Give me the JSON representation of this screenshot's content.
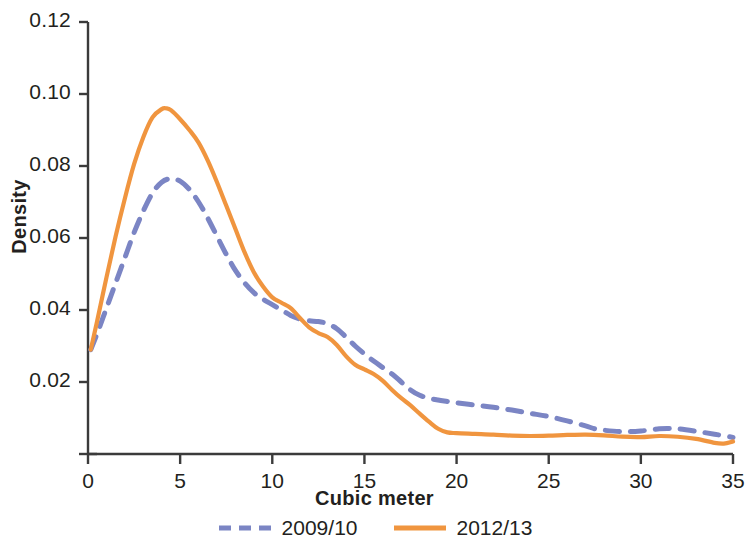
{
  "chart_data": {
    "type": "line",
    "title": "",
    "xlabel": "Cubic meter",
    "ylabel": "Density",
    "xlim": [
      0,
      35
    ],
    "ylim": [
      0,
      0.12
    ],
    "grid": false,
    "legend_position": "bottom",
    "xticks": [
      0,
      5,
      10,
      15,
      20,
      25,
      30,
      35
    ],
    "xtick_labels": [
      "0",
      "5",
      "10",
      "15",
      "20",
      "25",
      "30",
      "35"
    ],
    "yticks": [
      0.02,
      0.04,
      0.06,
      0.08,
      0.1,
      0.12
    ],
    "ytick_labels": [
      "0.02",
      "0.04",
      "0.06",
      "0.08",
      "0.10",
      "0.12"
    ],
    "series": [
      {
        "name": "2009/10",
        "color": "#7b85c4",
        "style": "dashed",
        "x": [
          0.15,
          0.5,
          1,
          1.5,
          2,
          2.5,
          3,
          3.5,
          4,
          4.5,
          5,
          5.5,
          6,
          6.5,
          7,
          7.5,
          8,
          8.5,
          9,
          9.5,
          10,
          10.5,
          11,
          11.5,
          12,
          12.5,
          13,
          13.5,
          14,
          14.5,
          15,
          15.5,
          16,
          16.5,
          17,
          17.5,
          18,
          18.5,
          19,
          19.5,
          20,
          21,
          22,
          23,
          24,
          25,
          26,
          27,
          27.5,
          28,
          29,
          30,
          31,
          31.5,
          32,
          33,
          34,
          35
        ],
        "y": [
          0.029,
          0.0335,
          0.0405,
          0.0475,
          0.0545,
          0.0615,
          0.0675,
          0.0725,
          0.0755,
          0.0765,
          0.0758,
          0.0735,
          0.07,
          0.0655,
          0.0605,
          0.0555,
          0.051,
          0.0475,
          0.0448,
          0.043,
          0.0415,
          0.04,
          0.0385,
          0.0375,
          0.037,
          0.0368,
          0.0362,
          0.0348,
          0.0325,
          0.03,
          0.0278,
          0.0258,
          0.024,
          0.0222,
          0.02,
          0.0178,
          0.0163,
          0.0155,
          0.015,
          0.0146,
          0.0142,
          0.0136,
          0.013,
          0.0122,
          0.0113,
          0.0104,
          0.0092,
          0.0078,
          0.007,
          0.0066,
          0.0062,
          0.0064,
          0.007,
          0.0071,
          0.007,
          0.0063,
          0.0055,
          0.0046
        ]
      },
      {
        "name": "2012/13",
        "color": "#f0953f",
        "style": "solid",
        "x": [
          0.15,
          0.5,
          1,
          1.5,
          2,
          2.5,
          3,
          3.5,
          4,
          4.25,
          4.5,
          5,
          5.5,
          6,
          6.5,
          7,
          7.5,
          8,
          8.5,
          9,
          9.5,
          10,
          10.5,
          11,
          11.5,
          12,
          12.5,
          13,
          13.5,
          14,
          14.5,
          15,
          15.5,
          16,
          16.5,
          17,
          17.5,
          18,
          18.5,
          19,
          19.5,
          20,
          21,
          22,
          23,
          24,
          25,
          26,
          27,
          28,
          29,
          30,
          31,
          32,
          33,
          34,
          34.5,
          35
        ],
        "y": [
          0.029,
          0.037,
          0.049,
          0.0605,
          0.071,
          0.0805,
          0.088,
          0.0935,
          0.0958,
          0.096,
          0.0955,
          0.093,
          0.09,
          0.0865,
          0.0815,
          0.0755,
          0.069,
          0.0625,
          0.056,
          0.0505,
          0.0465,
          0.0435,
          0.042,
          0.0405,
          0.0378,
          0.0352,
          0.0336,
          0.0325,
          0.0303,
          0.0272,
          0.0248,
          0.0235,
          0.0222,
          0.0203,
          0.0178,
          0.0155,
          0.0135,
          0.0112,
          0.009,
          0.007,
          0.006,
          0.0058,
          0.0056,
          0.0054,
          0.0051,
          0.005,
          0.0051,
          0.0053,
          0.0054,
          0.0052,
          0.0048,
          0.0047,
          0.005,
          0.0048,
          0.0042,
          0.0031,
          0.0029,
          0.0035
        ]
      }
    ]
  },
  "legend": {
    "entries": [
      {
        "label": "2009/10"
      },
      {
        "label": "2012/13"
      }
    ]
  },
  "axes": {
    "axis_color": "#3b3b3b"
  }
}
